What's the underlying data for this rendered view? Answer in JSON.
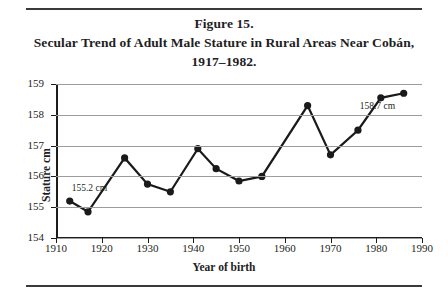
{
  "figure": {
    "title_lines": [
      "Figure 15.",
      "Secular Trend of Adult Male Stature in Rural Areas Near Cobán,",
      "1917–1982."
    ]
  },
  "chart_data": {
    "type": "line",
    "title": "Secular Trend of Adult Male Stature in Rural Areas Near Cobán, 1917–1982.",
    "xlabel": "Year of birth",
    "ylabel": "Stature cm",
    "xlim": [
      1910,
      1990
    ],
    "ylim": [
      154,
      159
    ],
    "xticks": [
      1910,
      1920,
      1930,
      1940,
      1950,
      1960,
      1970,
      1980,
      1990
    ],
    "yticks": [
      154,
      155,
      156,
      157,
      158,
      159
    ],
    "grid": "horizontal",
    "legend": "none",
    "marker": "filled-circle",
    "line_color": "#1a1a1a",
    "grid_color": "#9c9c9c",
    "x": [
      1913,
      1917,
      1925,
      1930,
      1935,
      1941,
      1945,
      1950,
      1955,
      1965,
      1970,
      1976,
      1981,
      1986
    ],
    "values": [
      155.2,
      154.85,
      156.6,
      155.75,
      155.5,
      156.9,
      156.25,
      155.85,
      156.0,
      158.3,
      156.7,
      157.5,
      158.55,
      158.7
    ],
    "annotations": [
      {
        "text": "155.2 cm",
        "x": 1913,
        "y": 155.2
      },
      {
        "text": "158.7 cm",
        "x": 1986,
        "y": 158.7
      }
    ]
  }
}
